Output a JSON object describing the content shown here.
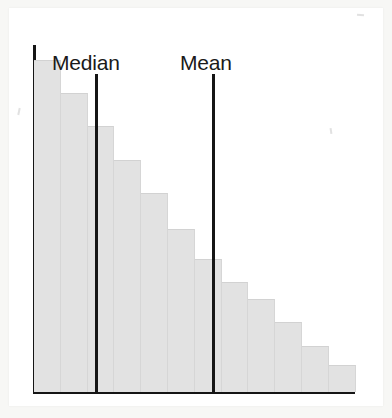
{
  "figure": {
    "background_color": "#ffffff",
    "paper_color": "#ffffff",
    "page_color": "#f7f7f5"
  },
  "markers": {
    "median": {
      "label": "Median",
      "x_value": 3.1,
      "line_color": "#151515"
    },
    "mean": {
      "label": "Mean",
      "x_value": 7.5,
      "line_color": "#151515"
    }
  },
  "chart_data": {
    "type": "bar",
    "title": "",
    "subtitle": "",
    "xlabel": "",
    "ylabel": "",
    "grid": false,
    "legend": false,
    "bar_color": "#e2e2e2",
    "axis_color": "#151515",
    "xlim": [
      0,
      12
    ],
    "ylim": [
      0,
      100
    ],
    "categories": [
      "1",
      "2",
      "3",
      "4",
      "5",
      "6",
      "7",
      "8",
      "9",
      "10",
      "11",
      "12"
    ],
    "values": [
      100,
      90,
      80,
      70,
      60,
      49,
      40,
      33,
      28,
      21,
      14,
      8
    ],
    "annotations": [
      {
        "text": "Median",
        "x": 3.1,
        "type": "vertical-line"
      },
      {
        "text": "Mean",
        "x": 7.5,
        "type": "vertical-line"
      }
    ]
  }
}
